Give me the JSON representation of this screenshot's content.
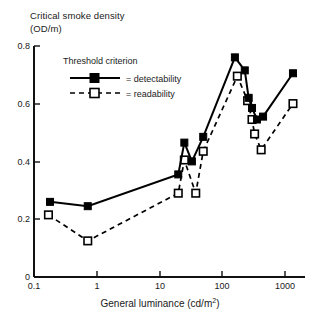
{
  "chart_data": {
    "type": "line",
    "title": "",
    "ylabel_lines": [
      "Critical smoke density",
      "(OD/m)"
    ],
    "xlabel": "General luminance (cd/m2)",
    "xlabel_base": "General luminance (cd/m",
    "xlabel_sup": "2",
    "xlabel_tail": ")",
    "xscale": "log",
    "xlim": [
      0.1,
      1800
    ],
    "ylim": [
      0,
      0.8
    ],
    "xticks": [
      0.1,
      1,
      10,
      100,
      1000
    ],
    "xtick_labels": [
      "0.1",
      "1",
      "10",
      "100",
      "1000"
    ],
    "yticks": [
      0,
      0.2,
      0.4,
      0.6,
      0.8
    ],
    "ytick_labels": [
      "0",
      "0.2",
      "0.4",
      "0.6",
      "0.8"
    ],
    "grid": false,
    "legend_position": "upper-left-inside",
    "legend_title": "Threshold criterion",
    "series": [
      {
        "name": "detectability",
        "legend_label": "= detectability",
        "marker": "filled-square",
        "linestyle": "solid",
        "color": "#000000",
        "x": [
          0.18,
          0.72,
          20,
          25,
          33,
          50,
          160,
          230,
          265,
          300,
          360,
          450,
          1350
        ],
        "y": [
          0.26,
          0.245,
          0.355,
          0.465,
          0.4,
          0.485,
          0.76,
          0.715,
          0.62,
          0.585,
          0.545,
          0.555,
          0.705
        ]
      },
      {
        "name": "readability",
        "legend_label": "= readability",
        "marker": "open-square",
        "linestyle": "dashed",
        "color": "#000000",
        "x": [
          0.17,
          0.72,
          20,
          25,
          38,
          50,
          175,
          255,
          300,
          330,
          420,
          1350
        ],
        "y": [
          0.215,
          0.125,
          0.29,
          0.405,
          0.29,
          0.435,
          0.695,
          0.61,
          0.545,
          0.495,
          0.44,
          0.6
        ]
      }
    ]
  },
  "axes": {
    "left_px": 34,
    "bottom_px": 277,
    "top_px": 46,
    "right_px": 305,
    "px_per_decade": 62.7,
    "px_per_0p2": 57.8
  }
}
